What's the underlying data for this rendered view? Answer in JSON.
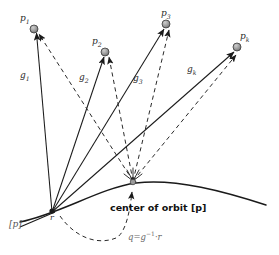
{
  "figure": {
    "colors": {
      "stroke": "#1a1a1a",
      "dashed": "#2a2a2a",
      "node_fill": "#8c8c8c",
      "node_stroke": "#2b2b2b",
      "label": "#2b2b2b",
      "equation": "#6a6a6a",
      "background": "#ffffff"
    },
    "points": [
      {
        "id": "p1",
        "label": "p",
        "sub": "1",
        "x": 34,
        "y": 29,
        "label_x": 20,
        "label_y": 14
      },
      {
        "id": "p2",
        "label": "p",
        "sub": "2",
        "x": 105,
        "y": 52,
        "label_x": 92,
        "label_y": 37
      },
      {
        "id": "p3",
        "label": "p",
        "sub": "3",
        "x": 166,
        "y": 24,
        "label_x": 161,
        "label_y": 9
      },
      {
        "id": "pk",
        "label": "p",
        "sub": "k",
        "x": 237,
        "y": 47,
        "label_x": 240,
        "label_y": 32
      }
    ],
    "g_labels": [
      {
        "id": "g1",
        "label": "g",
        "sub": "1",
        "x": 20,
        "y": 71
      },
      {
        "id": "g2",
        "label": "g",
        "sub": "2",
        "x": 79,
        "y": 73
      },
      {
        "id": "g3",
        "label": "g",
        "sub": "3",
        "x": 133,
        "y": 74
      },
      {
        "id": "gk",
        "label": "g",
        "sub": "k",
        "x": 187,
        "y": 65
      }
    ],
    "vertex_r": {
      "label": "r",
      "x": 52,
      "y": 212,
      "label_x": 50,
      "label_y": 214
    },
    "orbit_center": {
      "x": 133,
      "y": 183
    },
    "caption": "center of orbit [p]",
    "caption_x": 110,
    "caption_y": 203,
    "equation": {
      "lhs": "q",
      "eq": "=",
      "g": "g",
      "exp": "−1",
      "dot": "·",
      "rhs": "r"
    },
    "equation_x": 128,
    "equation_y": 231,
    "bracket_p": {
      "label": "[p]",
      "x": 9,
      "y": 220
    }
  }
}
